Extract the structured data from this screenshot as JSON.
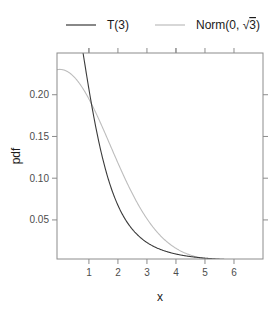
{
  "chart_data": {
    "type": "line",
    "title": "",
    "xlabel": "x",
    "ylabel": "pdf",
    "xlim": [
      -0.1,
      7.0
    ],
    "ylim": [
      0.0032,
      0.25
    ],
    "grid": false,
    "legend_position": "top",
    "x_ticks": [
      1,
      2,
      3,
      4,
      5,
      6
    ],
    "x_tick_labels": [
      "1",
      "2",
      "3",
      "4",
      "5",
      "6"
    ],
    "y_ticks": [
      0.05,
      0.1,
      0.15,
      0.2
    ],
    "y_tick_labels": [
      "0.05",
      "0.10",
      "0.15",
      "0.20"
    ],
    "x": [
      0,
      0.5,
      1,
      1.5,
      2,
      2.5,
      3,
      3.5,
      4,
      4.5,
      5,
      5.5,
      6,
      6.5,
      7
    ],
    "series": [
      {
        "name": "T(3)",
        "legend_label": "T(3)",
        "color": "#3a3a3a",
        "values": [
          0.3676,
          0.3125,
          0.2067,
          0.122,
          0.0675,
          0.0422,
          0.023,
          0.0142,
          0.0092,
          0.0062,
          0.0042,
          0.003,
          0.0021,
          0.0016,
          0.0012
        ]
      },
      {
        "name": "Norm(0, sqrt(3))",
        "legend_label_prefix": "Norm(0, ",
        "legend_label_radicand": "3",
        "legend_label_suffix": ")",
        "color": "#bdbdbd",
        "values": [
          0.2303,
          0.2209,
          0.195,
          0.1584,
          0.1184,
          0.0814,
          0.0517,
          0.0301,
          0.0162,
          0.008,
          0.0036,
          0.0015,
          0.0006,
          0.0002,
          0.0001
        ]
      }
    ]
  },
  "legend": {
    "items": [
      {
        "label": "T(3)",
        "color": "#3a3a3a"
      },
      {
        "label_prefix": "Norm(0, ",
        "label_radicand": "3",
        "label_suffix": ")",
        "color": "#bdbdbd"
      }
    ]
  },
  "axes": {
    "xlabel": "x",
    "ylabel": "pdf",
    "axis_color": "#8c8c8c"
  }
}
